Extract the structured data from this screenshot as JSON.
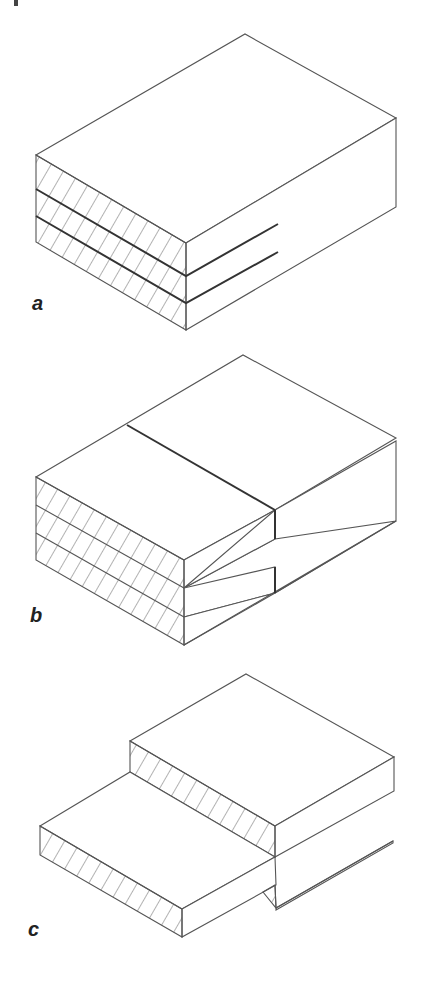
{
  "figure": {
    "panels": [
      {
        "id": "a",
        "label": "a",
        "description": "Three laminated layers glued flat (face-to-face), front cross-section hatched"
      },
      {
        "id": "b",
        "label": "b",
        "description": "Three layers stacked with top layer offset, front cross-section hatched, step visible at right"
      },
      {
        "id": "c",
        "label": "c",
        "description": "Two thin boards overlapping in a stepped lap joint, edges hatched"
      }
    ],
    "colors": {
      "line": "#555555",
      "bold_line": "#333333",
      "background": "#ffffff"
    }
  }
}
